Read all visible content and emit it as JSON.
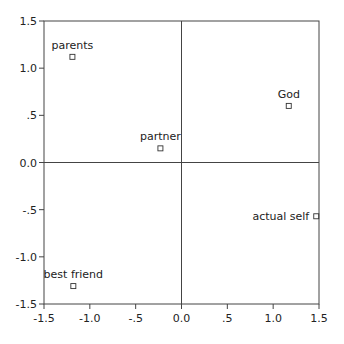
{
  "chart_data": {
    "type": "scatter",
    "title": "",
    "xlabel": "",
    "ylabel": "",
    "xlim": [
      -1.5,
      1.5
    ],
    "ylim": [
      -1.5,
      1.5
    ],
    "grid": false,
    "legend": null,
    "reference_lines": {
      "x": 0,
      "y": 0
    },
    "x_ticks": [
      "-1.5",
      "-1.0",
      "-.5",
      "0.0",
      ".5",
      "1.0",
      "1.5"
    ],
    "y_ticks": [
      "1.5",
      "1.0",
      ".5",
      "0.0",
      "-.5",
      "-1.0",
      "-1.5"
    ],
    "x_tick_values": [
      -1.5,
      -1.0,
      -0.5,
      0.0,
      0.5,
      1.0,
      1.5
    ],
    "y_tick_values": [
      1.5,
      1.0,
      0.5,
      0.0,
      -0.5,
      -1.0,
      -1.5
    ],
    "marker": "open-square",
    "points": [
      {
        "label": "parents",
        "x": -1.19,
        "y": 1.12,
        "label_pos": "above"
      },
      {
        "label": "partner",
        "x": -0.23,
        "y": 0.15,
        "label_pos": "above"
      },
      {
        "label": "God",
        "x": 1.17,
        "y": 0.6,
        "label_pos": "above"
      },
      {
        "label": "actual self",
        "x": 1.47,
        "y": -0.57,
        "label_pos": "left"
      },
      {
        "label": "best friend",
        "x": -1.18,
        "y": -1.31,
        "label_pos": "above"
      }
    ]
  },
  "colors": {
    "axis": "#444444",
    "text": "#222222",
    "marker": "#333333",
    "background": "#ffffff"
  }
}
